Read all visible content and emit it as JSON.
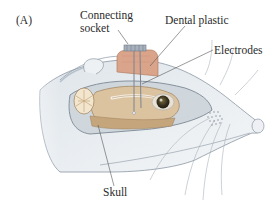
{
  "figure": {
    "panel_label": "(A)",
    "labels": {
      "connecting_socket_line1": "Connecting",
      "connecting_socket_line2": "socket",
      "dental_plastic": "Dental plastic",
      "electrodes": "Electrodes",
      "skull": "Skull"
    },
    "colors": {
      "fur": "#e6ebef",
      "fur_shade": "#c9d2da",
      "brain": "#dcc3a0",
      "brain_dark": "#c5a57c",
      "cerebellum": "#f2e6cf",
      "dental_plastic": "#d9a48a",
      "socket": "#a7b0bd",
      "eye": "#3b3420",
      "leader_line": "#555555"
    }
  }
}
